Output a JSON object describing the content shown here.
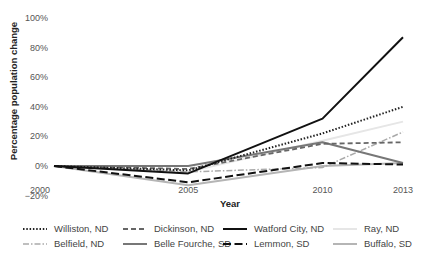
{
  "chart_data": {
    "type": "line",
    "title": "",
    "xlabel": "Year",
    "ylabel": "Percentage population change",
    "x": [
      2000,
      2005,
      2010,
      2013
    ],
    "x_tick_labels": [
      "2000",
      "2005",
      "2010",
      "2013"
    ],
    "y_tick_labels": [
      "100%",
      "80%",
      "60%",
      "40%",
      "20%",
      "0%",
      "−20%"
    ],
    "ylim": [
      -20,
      100
    ],
    "grid": false,
    "legend_position": "bottom",
    "series": [
      {
        "name": "Williston, ND",
        "values": [
          0,
          -3,
          22,
          40
        ],
        "color": "#222222",
        "style": "dotted",
        "width": 2
      },
      {
        "name": "Dickinson, ND",
        "values": [
          0,
          -2,
          15,
          16
        ],
        "color": "#666666",
        "style": "dashed",
        "width": 1.8
      },
      {
        "name": "Watford City, ND",
        "values": [
          0,
          -5,
          32,
          87
        ],
        "color": "#111111",
        "style": "solid",
        "width": 2
      },
      {
        "name": "Ray, ND",
        "values": [
          0,
          -4,
          17,
          30
        ],
        "color": "#e6e6e6",
        "style": "solid",
        "width": 2
      },
      {
        "name": "Belfield, ND",
        "values": [
          0,
          -4,
          -1,
          23
        ],
        "color": "#aaaaaa",
        "style": "dashdot",
        "width": 1.5
      },
      {
        "name": "Belle Fourche, SD",
        "values": [
          0,
          0,
          16,
          2
        ],
        "color": "#777777",
        "style": "solid",
        "width": 2
      },
      {
        "name": "Lemmon, SD",
        "values": [
          0,
          -11,
          2,
          1
        ],
        "color": "#111111",
        "style": "longdash",
        "width": 2
      },
      {
        "name": "Buffalo, SD",
        "values": [
          0,
          -13,
          0,
          2
        ],
        "color": "#b5b5b5",
        "style": "solid",
        "width": 2
      }
    ]
  },
  "legend": {
    "items": [
      {
        "label": "Williston, ND"
      },
      {
        "label": "Dickinson, ND"
      },
      {
        "label": "Watford City, ND"
      },
      {
        "label": "Ray, ND"
      },
      {
        "label": "Belfield, ND"
      },
      {
        "label": "Belle Fourche, SD"
      },
      {
        "label": "Lemmon, SD"
      },
      {
        "label": "Buffalo, SD"
      }
    ]
  }
}
